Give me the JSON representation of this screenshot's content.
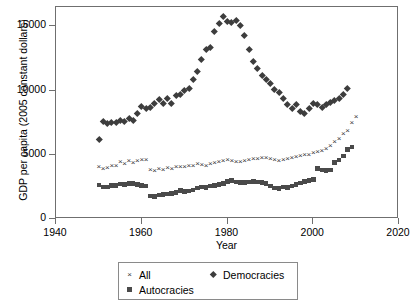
{
  "chart_data": {
    "type": "scatter",
    "title": "",
    "xlabel": "Year",
    "ylabel": "GDP per capita (2005 constant dollars)",
    "xlim": [
      1940,
      2020
    ],
    "ylim": [
      0,
      16500
    ],
    "xticks": [
      1940,
      1960,
      1980,
      2000,
      2020
    ],
    "yticks": [
      0,
      5000,
      10000,
      15000
    ],
    "xtick_labels": [
      "1940",
      "1960",
      "1980",
      "2000",
      "2020"
    ],
    "ytick_labels": [
      "0",
      "5000",
      "10000",
      "15000"
    ],
    "grid": false,
    "legend_position": "below-axes",
    "series": [
      {
        "name": "All",
        "marker": "x",
        "color": "#3a3a3a",
        "points": [
          [
            1950,
            4050
          ],
          [
            1951,
            3900
          ],
          [
            1952,
            3980
          ],
          [
            1953,
            4150
          ],
          [
            1954,
            4120
          ],
          [
            1955,
            4400
          ],
          [
            1956,
            4300
          ],
          [
            1957,
            4480
          ],
          [
            1958,
            4350
          ],
          [
            1959,
            4500
          ],
          [
            1960,
            4560
          ],
          [
            1961,
            4620
          ],
          [
            1962,
            3820
          ],
          [
            1963,
            3760
          ],
          [
            1964,
            3900
          ],
          [
            1965,
            3800
          ],
          [
            1966,
            3960
          ],
          [
            1967,
            3900
          ],
          [
            1968,
            4020
          ],
          [
            1969,
            4060
          ],
          [
            1970,
            4080
          ],
          [
            1971,
            4100
          ],
          [
            1972,
            4160
          ],
          [
            1973,
            4260
          ],
          [
            1974,
            4200
          ],
          [
            1975,
            4140
          ],
          [
            1976,
            4280
          ],
          [
            1977,
            4320
          ],
          [
            1978,
            4400
          ],
          [
            1979,
            4500
          ],
          [
            1980,
            4600
          ],
          [
            1981,
            4520
          ],
          [
            1982,
            4460
          ],
          [
            1983,
            4420
          ],
          [
            1984,
            4500
          ],
          [
            1985,
            4560
          ],
          [
            1986,
            4640
          ],
          [
            1987,
            4700
          ],
          [
            1988,
            4780
          ],
          [
            1989,
            4760
          ],
          [
            1990,
            4700
          ],
          [
            1991,
            4560
          ],
          [
            1992,
            4520
          ],
          [
            1993,
            4560
          ],
          [
            1994,
            4640
          ],
          [
            1995,
            4720
          ],
          [
            1996,
            4820
          ],
          [
            1997,
            4940
          ],
          [
            1998,
            4960
          ],
          [
            1999,
            5000
          ],
          [
            2000,
            5160
          ],
          [
            2001,
            5220
          ],
          [
            2002,
            5300
          ],
          [
            2003,
            5460
          ],
          [
            2004,
            5700
          ],
          [
            2005,
            5960
          ],
          [
            2006,
            6260
          ],
          [
            2007,
            6580
          ],
          [
            2008,
            6820
          ],
          [
            2009,
            7500
          ],
          [
            2010,
            7900
          ]
        ]
      },
      {
        "name": "Democracies",
        "marker": "diamond",
        "color": "#3d3d3d",
        "points": [
          [
            1950,
            6200
          ],
          [
            1951,
            7600
          ],
          [
            1952,
            7450
          ],
          [
            1953,
            7550
          ],
          [
            1954,
            7500
          ],
          [
            1955,
            7700
          ],
          [
            1956,
            7600
          ],
          [
            1957,
            7800
          ],
          [
            1958,
            7700
          ],
          [
            1959,
            8200
          ],
          [
            1960,
            8800
          ],
          [
            1961,
            8600
          ],
          [
            1962,
            8700
          ],
          [
            1963,
            9000
          ],
          [
            1964,
            9350
          ],
          [
            1965,
            9000
          ],
          [
            1966,
            9400
          ],
          [
            1967,
            9000
          ],
          [
            1968,
            9600
          ],
          [
            1969,
            9700
          ],
          [
            1970,
            10000
          ],
          [
            1971,
            10200
          ],
          [
            1972,
            10900
          ],
          [
            1973,
            11500
          ],
          [
            1974,
            12400
          ],
          [
            1975,
            13200
          ],
          [
            1976,
            13400
          ],
          [
            1977,
            14600
          ],
          [
            1978,
            15200
          ],
          [
            1979,
            15800
          ],
          [
            1980,
            15400
          ],
          [
            1981,
            15300
          ],
          [
            1982,
            15500
          ],
          [
            1983,
            15100
          ],
          [
            1984,
            14300
          ],
          [
            1985,
            13200
          ],
          [
            1986,
            12300
          ],
          [
            1987,
            11700
          ],
          [
            1988,
            11200
          ],
          [
            1989,
            10900
          ],
          [
            1990,
            10600
          ],
          [
            1991,
            10100
          ],
          [
            1992,
            9900
          ],
          [
            1993,
            9400
          ],
          [
            1994,
            8900
          ],
          [
            1995,
            8600
          ],
          [
            1996,
            8900
          ],
          [
            1997,
            8400
          ],
          [
            1998,
            8200
          ],
          [
            1999,
            8600
          ],
          [
            2000,
            9000
          ],
          [
            2001,
            8900
          ],
          [
            2002,
            8700
          ],
          [
            2003,
            8900
          ],
          [
            2004,
            9100
          ],
          [
            2005,
            9200
          ],
          [
            2006,
            9400
          ],
          [
            2007,
            9700
          ],
          [
            2008,
            10200
          ]
        ]
      },
      {
        "name": "Autocracies",
        "marker": "square",
        "color": "#4a4a4a",
        "points": [
          [
            1950,
            2650
          ],
          [
            1951,
            2500
          ],
          [
            1952,
            2480
          ],
          [
            1953,
            2600
          ],
          [
            1954,
            2620
          ],
          [
            1955,
            2720
          ],
          [
            1956,
            2700
          ],
          [
            1957,
            2760
          ],
          [
            1958,
            2740
          ],
          [
            1959,
            2700
          ],
          [
            1960,
            2620
          ],
          [
            1961,
            2580
          ],
          [
            1962,
            1800
          ],
          [
            1963,
            1750
          ],
          [
            1964,
            1880
          ],
          [
            1965,
            1900
          ],
          [
            1966,
            1960
          ],
          [
            1967,
            2000
          ],
          [
            1968,
            2060
          ],
          [
            1969,
            2200
          ],
          [
            1970,
            2150
          ],
          [
            1971,
            2180
          ],
          [
            1972,
            2250
          ],
          [
            1973,
            2400
          ],
          [
            1974,
            2480
          ],
          [
            1975,
            2460
          ],
          [
            1976,
            2560
          ],
          [
            1977,
            2620
          ],
          [
            1978,
            2700
          ],
          [
            1979,
            2780
          ],
          [
            1980,
            2900
          ],
          [
            1981,
            2980
          ],
          [
            1982,
            2880
          ],
          [
            1983,
            2820
          ],
          [
            1984,
            2860
          ],
          [
            1985,
            2880
          ],
          [
            1986,
            2900
          ],
          [
            1987,
            2880
          ],
          [
            1988,
            2820
          ],
          [
            1989,
            2760
          ],
          [
            1990,
            2560
          ],
          [
            1991,
            2420
          ],
          [
            1992,
            2380
          ],
          [
            1993,
            2500
          ],
          [
            1994,
            2460
          ],
          [
            1995,
            2560
          ],
          [
            1996,
            2700
          ],
          [
            1997,
            2800
          ],
          [
            1998,
            2900
          ],
          [
            1999,
            2980
          ],
          [
            2000,
            3060
          ],
          [
            2001,
            3950
          ],
          [
            2002,
            3820
          ],
          [
            2003,
            3760
          ],
          [
            2004,
            3800
          ],
          [
            2005,
            4400
          ],
          [
            2006,
            4600
          ],
          [
            2007,
            4900
          ],
          [
            2008,
            5400
          ],
          [
            2009,
            5600
          ]
        ]
      }
    ]
  },
  "axes": {
    "y_title": "GDP per capita (2005 constant dollars)",
    "x_title": "Year"
  },
  "legend": {
    "entries": [
      {
        "label": "All",
        "marker": "x"
      },
      {
        "label": "Democracies",
        "marker": "diamond"
      },
      {
        "label": "Autocracies",
        "marker": "square"
      }
    ]
  }
}
